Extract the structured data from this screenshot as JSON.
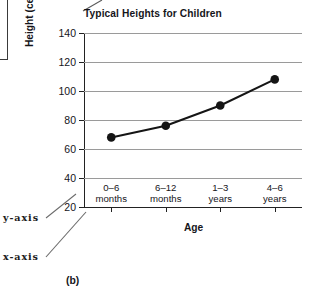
{
  "figure": {
    "label": "(b)",
    "title": "Typical Heights for Children"
  },
  "annotations": {
    "y_axis_callout": "y-axis",
    "x_axis_callout": "x-axis"
  },
  "chart_data": {
    "type": "line",
    "title": "Typical Heights for Children",
    "xlabel": "Age",
    "ylabel": "Height (centimetres)",
    "categories": [
      "0–6\nmonths",
      "6–12\nmonths",
      "1–3\nyears",
      "4–6\nyears"
    ],
    "category_lines": [
      [
        "0–6",
        "months"
      ],
      [
        "6–12",
        "months"
      ],
      [
        "1–3",
        "years"
      ],
      [
        "4–6",
        "years"
      ]
    ],
    "values": [
      68,
      76,
      90,
      108
    ],
    "ylim": [
      20,
      140
    ],
    "yticks": [
      20,
      40,
      60,
      80,
      100,
      120,
      140
    ],
    "ytick_labels": [
      "20",
      "40",
      "60",
      "80",
      "100",
      "120",
      "140"
    ],
    "grid": true,
    "legend": "none",
    "marker": "filled-circle",
    "line_color": "#151515",
    "grid_color": "#9a9a9a",
    "axis_color": "#222222"
  }
}
